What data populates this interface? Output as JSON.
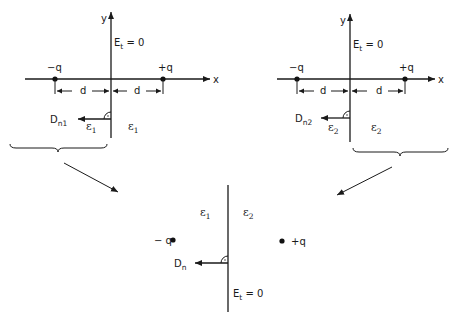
{
  "diagram": {
    "colors": {
      "ink": "#1a1a1a",
      "background": "#ffffff"
    },
    "left_panel": {
      "axis_x_label": "x",
      "axis_y_label": "y",
      "field_label_main": "E",
      "field_label_sub": "t",
      "field_label_value": " = 0",
      "charge_left": "−q",
      "charge_right": "+q",
      "distance_left": "d",
      "distance_right": "d",
      "flux_label_main": "D",
      "flux_label_sub": "n1",
      "eps_left_main": "ε",
      "eps_left_sub": "1",
      "eps_right_main": "ε",
      "eps_right_sub": "1"
    },
    "right_panel": {
      "axis_x_label": "x",
      "axis_y_label": "y",
      "field_label_main": "E",
      "field_label_sub": "t",
      "field_label_value": " = 0",
      "charge_left": "−q",
      "charge_right": "+q",
      "distance_left": "d",
      "distance_right": "d",
      "flux_label_main": "D",
      "flux_label_sub": "n2",
      "eps_left_main": "ε",
      "eps_left_sub": "2",
      "eps_right_main": "ε",
      "eps_right_sub": "2"
    },
    "combined_panel": {
      "eps_left_main": "ε",
      "eps_left_sub": "1",
      "eps_right_main": "ε",
      "eps_right_sub": "2",
      "charge_left": "− q",
      "charge_right": "+q",
      "flux_label_main": "D",
      "flux_label_sub": "n",
      "field_label_main": "E",
      "field_label_sub": "t",
      "field_label_value": " = 0"
    }
  }
}
